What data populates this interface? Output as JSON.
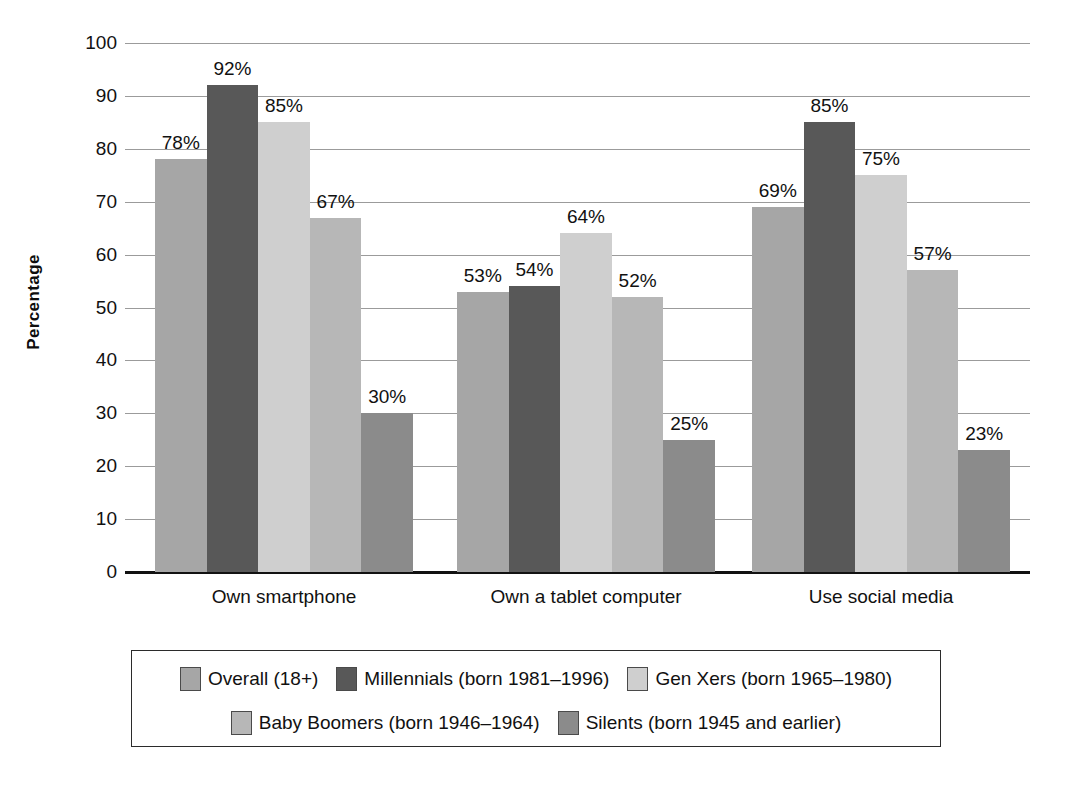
{
  "chart_data": {
    "type": "bar",
    "title": "",
    "xlabel": "",
    "ylabel": "Percentage",
    "ylim": [
      0,
      100
    ],
    "ytick_step": 10,
    "yticks": [
      "100",
      "90",
      "80",
      "70",
      "60",
      "50",
      "40",
      "30",
      "20",
      "10",
      "0"
    ],
    "grid": true,
    "legend_position": "bottom",
    "value_suffix": "%",
    "categories": [
      "Own smartphone",
      "Own a tablet computer",
      "Use social media"
    ],
    "series": [
      {
        "name": "Overall (18+)",
        "color": "#a6a6a6",
        "values": [
          78,
          53,
          69
        ],
        "labels": [
          "78%",
          "53%",
          "69%"
        ]
      },
      {
        "name": "Millennials (born 1981–1996)",
        "color": "#585858",
        "values": [
          92,
          54,
          85
        ],
        "labels": [
          "92%",
          "54%",
          "85%"
        ]
      },
      {
        "name": "Gen Xers (born 1965–1980)",
        "color": "#cfcfcf",
        "values": [
          85,
          64,
          75
        ],
        "labels": [
          "85%",
          "64%",
          "75%"
        ]
      },
      {
        "name": "Baby Boomers (born 1946–1964)",
        "color": "#b7b7b7",
        "values": [
          67,
          52,
          57
        ],
        "labels": [
          "67%",
          "52%",
          "57%"
        ]
      },
      {
        "name": "Silents (born 1945 and earlier)",
        "color": "#8b8b8b",
        "values": [
          30,
          25,
          23
        ],
        "labels": [
          "30%",
          "25%",
          "23%"
        ]
      }
    ],
    "legend": [
      {
        "label": "Overall (18+)",
        "color": "#a6a6a6"
      },
      {
        "label": "Millennials (born 1981–1996)",
        "color": "#585858"
      },
      {
        "label": "Gen Xers (born 1965–1980)",
        "color": "#cfcfcf"
      },
      {
        "label": "Baby Boomers (born 1946–1964)",
        "color": "#b7b7b7"
      },
      {
        "label": "Silents (born 1945 and earlier)",
        "color": "#8b8b8b"
      }
    ],
    "colors": {
      "axis": "#121212",
      "grid": "#9b9b9b",
      "text": "#111111",
      "background": "#ffffff"
    }
  }
}
